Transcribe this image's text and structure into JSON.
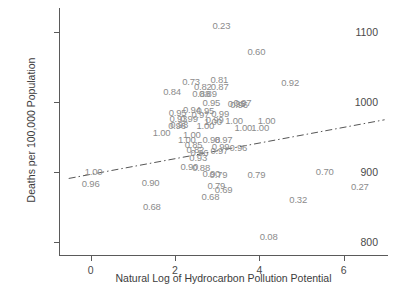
{
  "chart_data": {
    "type": "scatter",
    "title": "",
    "xlabel": "Natural Log of Hydrocarbon Pollution Potential",
    "ylabel": "Deaths per 100,000 Population",
    "xlim": [
      -0.75,
      7.05
    ],
    "ylim": [
      780,
      1135
    ],
    "xticks": [
      0,
      2,
      4,
      6
    ],
    "xtick_labels": [
      "0",
      "2",
      "4",
      "6"
    ],
    "yticks": [
      800,
      900,
      1000,
      1100
    ],
    "ytick_labels": [
      "800",
      "900",
      "1000",
      "1100"
    ],
    "grid": false,
    "legend": null,
    "marker_style": "value-label",
    "points": [
      {
        "label": "0.23",
        "x": 3.1,
        "y": 1110
      },
      {
        "label": "0.60",
        "x": 3.93,
        "y": 1074
      },
      {
        "label": "0.73",
        "x": 2.38,
        "y": 1031
      },
      {
        "label": "0.81",
        "x": 3.05,
        "y": 1033
      },
      {
        "label": "0.82",
        "x": 2.66,
        "y": 1024
      },
      {
        "label": "0.87",
        "x": 3.06,
        "y": 1023
      },
      {
        "label": "0.92",
        "x": 4.73,
        "y": 1029
      },
      {
        "label": "0.84",
        "x": 1.93,
        "y": 1016
      },
      {
        "label": "0.88",
        "x": 2.62,
        "y": 1014
      },
      {
        "label": "0.89",
        "x": 2.78,
        "y": 1013
      },
      {
        "label": "0.95",
        "x": 2.86,
        "y": 1000
      },
      {
        "label": "0.97",
        "x": 3.6,
        "y": 1000
      },
      {
        "label": "0.95",
        "x": 3.46,
        "y": 999
      },
      {
        "label": "0.96",
        "x": 3.52,
        "y": 998
      },
      {
        "label": "0.94",
        "x": 2.4,
        "y": 990
      },
      {
        "label": "0.95",
        "x": 2.72,
        "y": 989
      },
      {
        "label": "0.95",
        "x": 2.06,
        "y": 986
      },
      {
        "label": "0.99",
        "x": 3.07,
        "y": 984
      },
      {
        "label": "0.97",
        "x": 2.6,
        "y": 983
      },
      {
        "label": "0.93",
        "x": 2.08,
        "y": 978
      },
      {
        "label": "0.99",
        "x": 2.33,
        "y": 977
      },
      {
        "label": "0.99",
        "x": 2.94,
        "y": 976
      },
      {
        "label": "1.00",
        "x": 3.4,
        "y": 975
      },
      {
        "label": "1.00",
        "x": 4.17,
        "y": 975
      },
      {
        "label": "1.00",
        "x": 2.9,
        "y": 973
      },
      {
        "label": "0.98",
        "x": 2.1,
        "y": 969
      },
      {
        "label": "1.00",
        "x": 2.72,
        "y": 968
      },
      {
        "label": "0.96",
        "x": 2.05,
        "y": 967
      },
      {
        "label": "1.00",
        "x": 3.62,
        "y": 965
      },
      {
        "label": "1.00",
        "x": 4.02,
        "y": 965
      },
      {
        "label": "1.00",
        "x": 1.68,
        "y": 957
      },
      {
        "label": "1.00",
        "x": 2.4,
        "y": 955
      },
      {
        "label": "1.00",
        "x": 2.28,
        "y": 948
      },
      {
        "label": "0.98",
        "x": 2.86,
        "y": 947
      },
      {
        "label": "0.97",
        "x": 3.15,
        "y": 947
      },
      {
        "label": "0.99",
        "x": 3.08,
        "y": 938
      },
      {
        "label": "0.96",
        "x": 3.5,
        "y": 936
      },
      {
        "label": "0.97",
        "x": 3.05,
        "y": 932
      },
      {
        "label": "0.85",
        "x": 2.44,
        "y": 940
      },
      {
        "label": "0.82",
        "x": 2.48,
        "y": 933
      },
      {
        "label": "0.96",
        "x": 2.58,
        "y": 929
      },
      {
        "label": "0.93",
        "x": 2.55,
        "y": 921
      },
      {
        "label": "1.00",
        "x": 0.07,
        "y": 902
      },
      {
        "label": "0.90",
        "x": 2.34,
        "y": 909
      },
      {
        "label": "0.88",
        "x": 2.62,
        "y": 908
      },
      {
        "label": "0.90",
        "x": 2.86,
        "y": 899
      },
      {
        "label": "0.79",
        "x": 3.03,
        "y": 898
      },
      {
        "label": "0.79",
        "x": 3.93,
        "y": 897
      },
      {
        "label": "0.70",
        "x": 5.55,
        "y": 901
      },
      {
        "label": "0.96",
        "x": 0.0,
        "y": 885
      },
      {
        "label": "0.90",
        "x": 1.42,
        "y": 886
      },
      {
        "label": "0.79",
        "x": 2.98,
        "y": 882
      },
      {
        "label": "0.69",
        "x": 3.15,
        "y": 876
      },
      {
        "label": "0.27",
        "x": 6.38,
        "y": 880
      },
      {
        "label": "0.68",
        "x": 2.84,
        "y": 866
      },
      {
        "label": "0.32",
        "x": 4.92,
        "y": 862
      },
      {
        "label": "0.68",
        "x": 1.45,
        "y": 852
      },
      {
        "label": "0.08",
        "x": 4.22,
        "y": 809
      }
    ],
    "trend_line": {
      "style": "dash-dot",
      "color": "#555555",
      "x_start": -0.52,
      "y_start": 891,
      "x_end": 6.97,
      "y_end": 975
    }
  }
}
